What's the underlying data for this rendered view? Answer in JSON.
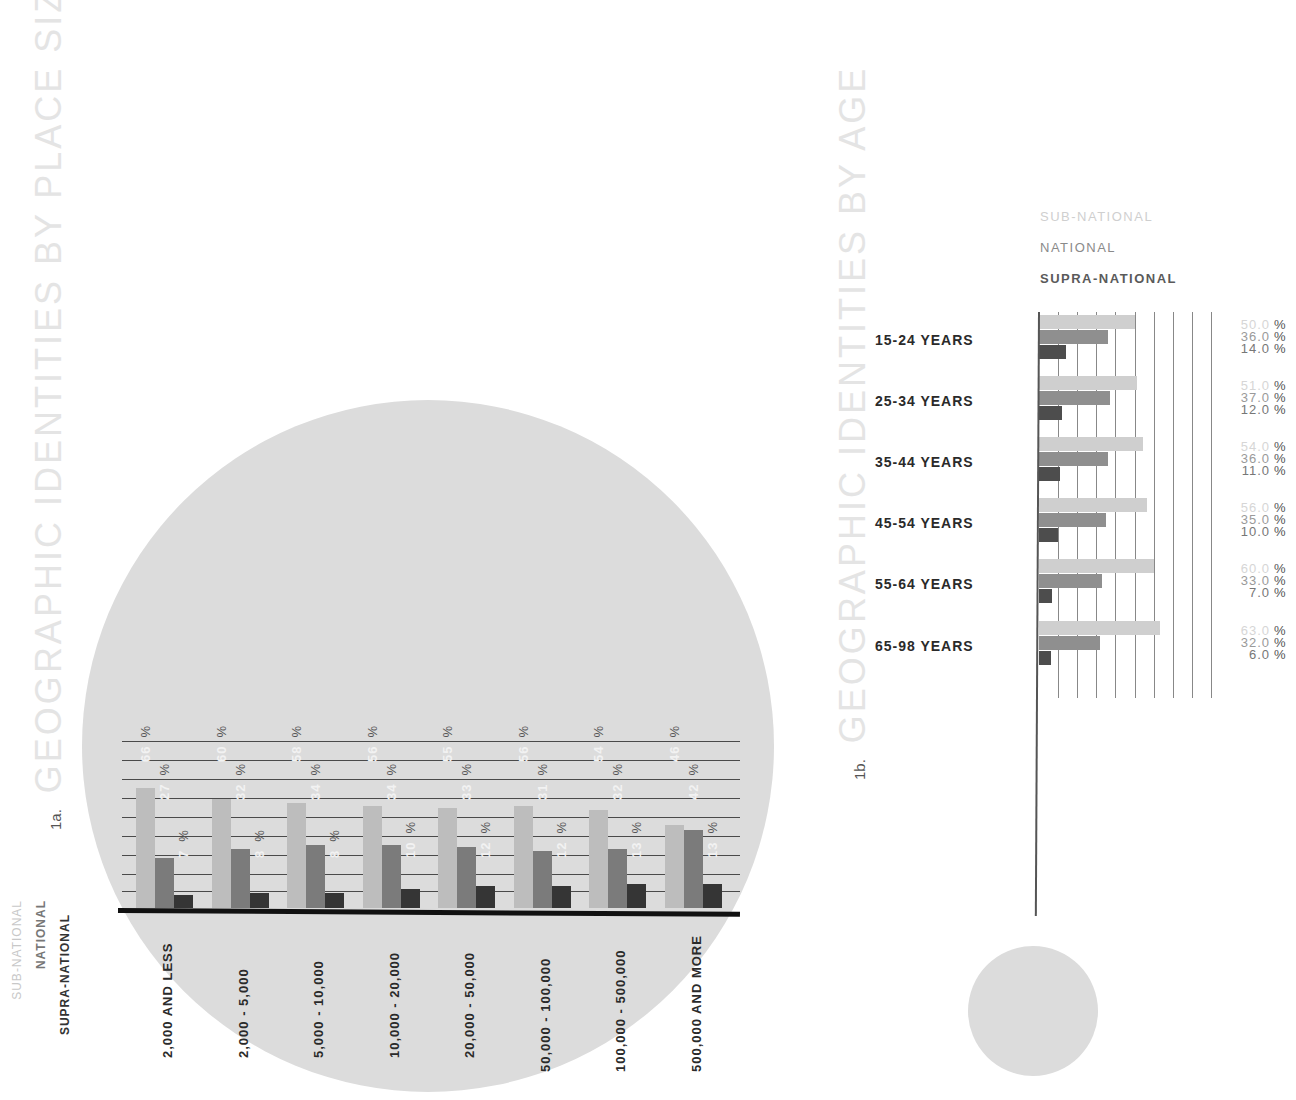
{
  "colors": {
    "sub_national": "#bdbdbd",
    "national": "#7b7b7b",
    "supra_national": "#353535",
    "circle": "#dcdcdc",
    "title": "#e4e4e4"
  },
  "chart_data": [
    {
      "id": "1a",
      "type": "bar",
      "title": "GEOGRAPHIC IDENTITIES BY PLACE SIZE",
      "figure_number": "1a.",
      "xlabel": "",
      "ylabel": "",
      "unit": "%",
      "grid": true,
      "legend_position": "bottom-left (rotated)",
      "categories": [
        "2,000 AND LESS",
        "2,000 - 5,000",
        "5,000 - 10,000",
        "10,000 - 20,000",
        "20,000 - 50,000",
        "50,000 - 100,000",
        "100,000 - 500,000",
        "500,000 AND MORE"
      ],
      "series": [
        {
          "name": "SUB-NATIONAL",
          "values": [
            66,
            60,
            58,
            56,
            55,
            56,
            54,
            46
          ]
        },
        {
          "name": "NATIONAL",
          "values": [
            27,
            32,
            34,
            34,
            33,
            31,
            32,
            42
          ]
        },
        {
          "name": "SUPRA-NATIONAL",
          "values": [
            7,
            8,
            8,
            10,
            12,
            12,
            13,
            13
          ]
        }
      ],
      "ylim": [
        0,
        100
      ]
    },
    {
      "id": "1b",
      "type": "bar",
      "orientation": "horizontal",
      "title": "GEOGRAPHIC IDENTITIES BY AGE",
      "figure_number": "1b.",
      "unit": "%",
      "grid": true,
      "legend_position": "top",
      "categories": [
        "15-24 YEARS",
        "25-34 YEARS",
        "35-44 YEARS",
        "45-54 YEARS",
        "55-64 YEARS",
        "65-98 YEARS"
      ],
      "series": [
        {
          "name": "SUB-NATIONAL",
          "values": [
            50.0,
            51.0,
            54.0,
            56.0,
            60.0,
            63.0
          ]
        },
        {
          "name": "NATIONAL",
          "values": [
            36.0,
            37.0,
            36.0,
            35.0,
            33.0,
            32.0
          ]
        },
        {
          "name": "SUPRA-NATIONAL",
          "values": [
            14.0,
            12.0,
            11.0,
            10.0,
            7.0,
            6.0
          ]
        }
      ],
      "xlim": [
        0,
        100
      ]
    }
  ],
  "chart1": {
    "number": "1a.",
    "title": "GEOGRAPHIC IDENTITIES BY PLACE SIZE",
    "legend": [
      "SUB-NATIONAL",
      "NATIONAL",
      "SUPRA-NATIONAL"
    ],
    "pct_symbol": "%"
  },
  "chart2": {
    "number": "1b.",
    "title": "GEOGRAPHIC IDENTITIES BY AGE",
    "legend": [
      "SUB-NATIONAL",
      "NATIONAL",
      "SUPRA-NATIONAL"
    ],
    "pct_symbol": "%",
    "rows": [
      {
        "label": "15-24 YEARS",
        "values": [
          "50.0",
          "36.0",
          "14.0"
        ]
      },
      {
        "label": "25-34 YEARS",
        "values": [
          "51.0",
          "37.0",
          "12.0"
        ]
      },
      {
        "label": "35-44 YEARS",
        "values": [
          "54.0",
          "36.0",
          "11.0"
        ]
      },
      {
        "label": "45-54 YEARS",
        "values": [
          "56.0",
          "35.0",
          "10.0"
        ]
      },
      {
        "label": "55-64 YEARS",
        "values": [
          "60.0",
          "33.0",
          "7.0"
        ]
      },
      {
        "label": "65-98 YEARS",
        "values": [
          "63.0",
          "32.0",
          "6.0"
        ]
      }
    ]
  }
}
